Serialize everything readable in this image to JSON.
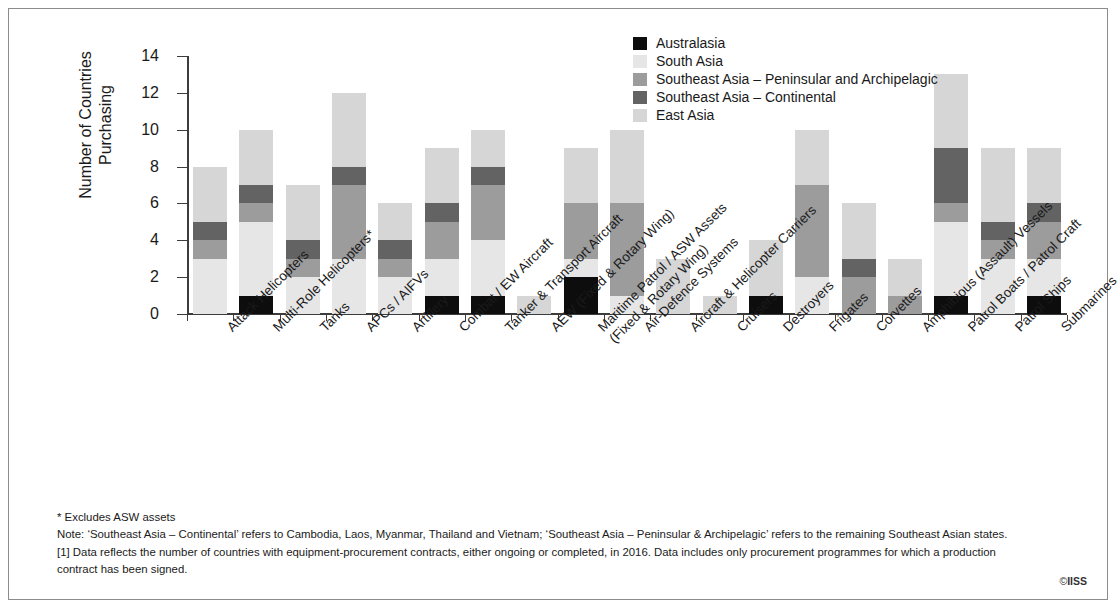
{
  "chart_data": {
    "type": "bar",
    "stacked": true,
    "title": "",
    "xlabel": "",
    "ylabel": "Number of Countries Purchasing",
    "ylim": [
      0,
      14
    ],
    "yticks": [
      0,
      2,
      4,
      6,
      8,
      10,
      12,
      14
    ],
    "grid": false,
    "legend_position": "top-center",
    "categories": [
      "Attack Helicopters",
      "Multi-Role Helicopters*",
      "Tanks",
      "APCs / AIFVs",
      "Artillery",
      "Combat / EW Aircraft",
      "Tanker & Transport Aircraft",
      "AEW (Fixed & Rotary Wing)",
      "Maritime Patrol / ASW Assets (Fixed & Rotary Wing)",
      "Air-Defence Systems",
      "Aircraft & Helicopter Carriers",
      "Cruisers",
      "Destroyers",
      "Frigates",
      "Corvettes",
      "Amphibious (Assault) Vessels",
      "Patrol Boats / Patrol Craft",
      "Patrol Ships",
      "Submarines"
    ],
    "category_lines": [
      [
        "Attack Helicopters"
      ],
      [
        "Multi-Role Helicopters*"
      ],
      [
        "Tanks"
      ],
      [
        "APCs / AIFVs"
      ],
      [
        "Artillery"
      ],
      [
        "Combat / EW Aircraft"
      ],
      [
        "Tanker & Transport Aircraft"
      ],
      [
        "AEW (Fixed & Rotary Wing)"
      ],
      [
        "Maritime Patrol / ASW Assets",
        "(Fixed & Rotary Wing)"
      ],
      [
        "Air-Defence Systems"
      ],
      [
        "Aircraft & Helicopter Carriers"
      ],
      [
        "Cruisers"
      ],
      [
        "Destroyers"
      ],
      [
        "Frigates"
      ],
      [
        "Corvettes"
      ],
      [
        "Amphibious (Assault) Vessels"
      ],
      [
        "Patrol Boats / Patrol Craft"
      ],
      [
        "Patrol Ships"
      ],
      [
        "Submarines"
      ]
    ],
    "series": [
      {
        "name": "Australasia",
        "color": "#0d0d0d",
        "values": [
          0,
          1,
          0,
          0,
          0,
          1,
          1,
          0,
          2,
          0,
          0,
          0,
          1,
          0,
          0,
          0,
          1,
          0,
          1
        ]
      },
      {
        "name": "South Asia",
        "color": "#e6e6e6",
        "values": [
          3,
          4,
          2,
          3,
          2,
          2,
          3,
          0,
          1,
          1,
          0,
          0,
          0,
          2,
          0,
          0,
          4,
          3,
          2
        ]
      },
      {
        "name": "Southeast Asia – Peninsular and Archipelagic",
        "color": "#9c9c9c",
        "values": [
          1,
          1,
          1,
          4,
          1,
          2,
          3,
          0,
          3,
          5,
          0,
          0,
          0,
          5,
          2,
          1,
          1,
          1,
          2
        ]
      },
      {
        "name": "Southeast Asia – Continental",
        "color": "#636363",
        "values": [
          1,
          1,
          1,
          1,
          1,
          1,
          1,
          0,
          0,
          0,
          0,
          0,
          0,
          0,
          1,
          0,
          3,
          1,
          1
        ]
      },
      {
        "name": "East Asia",
        "color": "#d6d6d6",
        "values": [
          3,
          3,
          3,
          4,
          2,
          3,
          2,
          1,
          3,
          4,
          3,
          1,
          3,
          3,
          3,
          2,
          4,
          4,
          3
        ]
      }
    ],
    "totals": [
      8,
      10,
      7,
      12,
      6,
      9,
      10,
      1,
      9,
      10,
      3,
      1,
      4,
      10,
      6,
      3,
      13,
      9,
      9
    ]
  },
  "legend": {
    "items": [
      {
        "label": "Australasia",
        "color": "#0d0d0d"
      },
      {
        "label": "South Asia",
        "color": "#e6e6e6"
      },
      {
        "label": "Southeast Asia – Peninsular and Archipelagic",
        "color": "#9c9c9c"
      },
      {
        "label": "Southeast Asia – Continental",
        "color": "#636363"
      },
      {
        "label": "East Asia",
        "color": "#d6d6d6"
      }
    ]
  },
  "axis": {
    "y_title_line1": "Number of Countries",
    "y_title_line2": "Purchasing"
  },
  "notes": {
    "line1": "* Excludes ASW assets",
    "line2": "Note: ‘Southeast Asia – Continental’ refers to Cambodia, Laos, Myanmar, Thailand and Vietnam; ‘Southeast Asia – Peninsular & Archipelagic’ refers to the remaining Southeast Asian states.",
    "line3": "[1] Data reflects the number of countries with equipment-procurement contracts, either ongoing or completed, in 2016. Data includes only procurement programmes for which a production",
    "line4": "contract has been signed."
  },
  "copyright": {
    "symbol": "©",
    "owner": "IISS"
  }
}
